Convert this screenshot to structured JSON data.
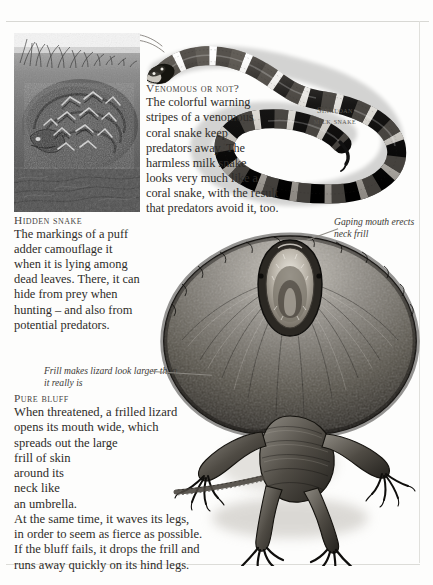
{
  "page": {
    "background_color": "#fdfdfc",
    "text_color": "#2e2c29",
    "rule_color": "#d8d8d4"
  },
  "photo": {
    "caption_heading": "Hidden snake",
    "alt_name": "puff-adder-camouflage-photo"
  },
  "venomous_block": {
    "heading": "Venomous or not?",
    "lines": [
      "The colorful warning",
      "stripes of a venomous",
      "coral snake keep",
      "predators away. The",
      "harmless milk snake",
      "looks very much like a",
      "coral snake, with the result",
      "that predators avoid it, too."
    ]
  },
  "hidden_block": {
    "heading": "Hidden snake",
    "lines": [
      "The markings of a puff",
      "adder camouflage it",
      "when it is lying among",
      "dead leaves. There, it can",
      "hide from prey when",
      "hunting – and also from",
      "potential predators."
    ]
  },
  "bluff_block": {
    "heading": "Pure bluff",
    "lines": [
      "When threatened, a frilled lizard",
      "opens its mouth wide, which",
      "spreads out the large",
      "frill of skin",
      "around its",
      "neck like",
      "an umbrella.",
      "At the same time, it waves its legs,",
      "in order to seem as fierce as possible.",
      "If the bluff fails, it drops the frill and",
      "runs away quickly on its hind legs."
    ]
  },
  "annotations": {
    "gaping_mouth": "Gaping mouth erects neck frill",
    "frill_size": "Frill makes lizard look larger than it really is"
  },
  "snake_label": {
    "line1": "Sinaloan",
    "line2": "milk snake"
  },
  "illustrations": {
    "snake_name": "sinaloan-milk-snake-illustration",
    "lizard_name": "frilled-lizard-illustration"
  }
}
